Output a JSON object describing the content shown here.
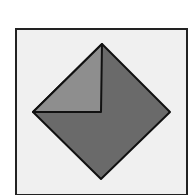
{
  "diagram": {
    "canvas": {
      "width": 190,
      "height": 195,
      "background": "#ffffff"
    },
    "frame": {
      "x": 16,
      "y": 29,
      "width": 171,
      "height": 166,
      "fill": "#f0f0f0",
      "stroke": "#222222",
      "stroke_width": 2
    },
    "diamond": {
      "points": {
        "top": [
          102,
          44
        ],
        "right": [
          170,
          112
        ],
        "bottom": [
          101,
          179
        ],
        "left": [
          33,
          112
        ]
      },
      "fill": "#6a6a6a",
      "stroke": "#111111",
      "stroke_width": 2
    },
    "fold_triangle": {
      "points": {
        "top": [
          102,
          44
        ],
        "corner": [
          101,
          112
        ],
        "left": [
          33,
          112
        ]
      },
      "fill": "#8e8e8e",
      "stroke": "#111111",
      "stroke_width": 2
    }
  }
}
